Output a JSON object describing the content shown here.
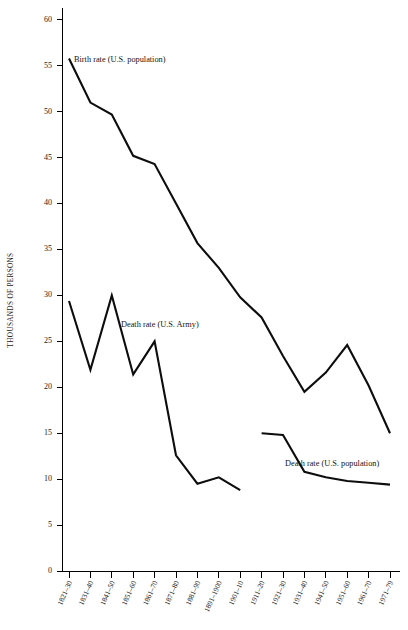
{
  "chart_data": {
    "type": "line",
    "title": "",
    "xlabel": "",
    "ylabel": "THOUSANDS OF PERSONS",
    "ylim": [
      0,
      62
    ],
    "yticks": [
      0,
      5,
      10,
      15,
      20,
      25,
      30,
      35,
      40,
      45,
      50,
      55,
      60
    ],
    "grid": false,
    "legend_position": "inline-annotations",
    "categories": [
      "1821–30",
      "1831–40",
      "1841–50",
      "1851–60",
      "1861–70",
      "1871–80",
      "1881–90",
      "1891–1900",
      "1901–10",
      "1911–20",
      "1921–30",
      "1931–40",
      "1941–50",
      "1951–60",
      "1961–70",
      "1971–79"
    ],
    "series": [
      {
        "name": "Birth rate (U.S. population)",
        "label_anchor_category": "1831–40",
        "values": [
          55.8,
          51.0,
          49.7,
          45.2,
          44.3,
          40.0,
          35.7,
          33.0,
          29.8,
          27.6,
          23.4,
          19.5,
          21.6,
          24.6,
          20.2,
          15.0
        ]
      },
      {
        "name": "Death rate (U.S. Army)",
        "label_anchor_category": "1841–50",
        "values": [
          29.4,
          21.9,
          30.0,
          21.4,
          25.0,
          12.6,
          9.5,
          10.2,
          8.8,
          null,
          null,
          null,
          null,
          null,
          null,
          null
        ]
      },
      {
        "name": "Death rate (U.S. population)",
        "label_anchor_category": "1941–50",
        "values": [
          null,
          null,
          null,
          null,
          null,
          null,
          null,
          null,
          null,
          15.0,
          14.8,
          10.8,
          10.2,
          9.8,
          9.6,
          9.4
        ]
      }
    ]
  },
  "annotations": [
    {
      "text": "Birth rate (U.S. population)",
      "name": "birth-rate-annotation"
    },
    {
      "text": "Death rate (U.S. Army)",
      "name": "army-death-rate-annotation"
    },
    {
      "text": "Death rate (U.S. population)",
      "name": "population-death-rate-annotation"
    }
  ]
}
